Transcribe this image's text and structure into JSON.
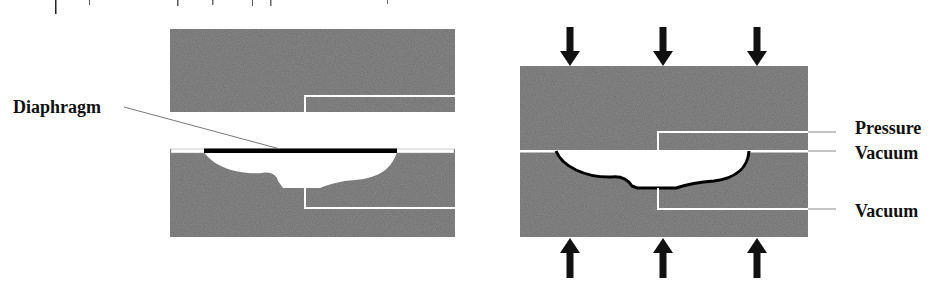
{
  "figure": {
    "type": "process-schematic",
    "panels": [
      {
        "id": "left",
        "description": "Open mold halves with diaphragm on lower mold",
        "labels": [
          {
            "text": "Diaphragm",
            "x": 13,
            "y": 113
          }
        ]
      },
      {
        "id": "right",
        "description": "Closed mold under press force with pressure and vacuum ports",
        "labels": [
          {
            "text": "Pressure",
            "x": 855,
            "y": 134
          },
          {
            "text": "Vacuum",
            "x": 855,
            "y": 159
          },
          {
            "text": "Vacuum",
            "x": 855,
            "y": 217
          }
        ],
        "arrows_top_count": 3,
        "arrows_bottom_count": 3
      }
    ]
  },
  "labels": {
    "diaphragm": "Diaphragm",
    "pressure": "Pressure",
    "vacuum_upper": "Vacuum",
    "vacuum_lower": "Vacuum"
  },
  "colors": {
    "mold_fill": "#6e6e6e",
    "channel": "#ffffff",
    "diaphragm": "#000000",
    "arrow": "#111111",
    "leader_line": "#777777",
    "label_text": "#111111"
  },
  "icons": {
    "force_arrow_down": "arrow-down",
    "force_arrow_up": "arrow-up"
  }
}
